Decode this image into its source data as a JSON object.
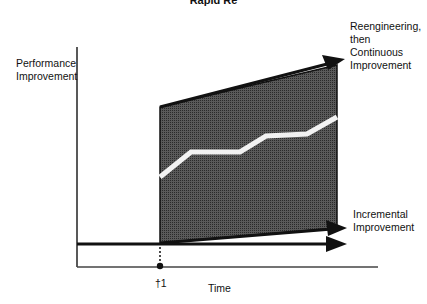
{
  "title": "Rapid Re",
  "y_axis_label": "Performance\nImprovement",
  "x_axis_label": "Time",
  "marker_label": "†1",
  "upper_label": "Reengineering,\nthen\nContinuous\nImprovement",
  "lower_label": "Incremental\nImprovement",
  "colors": {
    "shade": "#4a4a4a",
    "line": "#111111",
    "highlight": "#f2f2f2"
  }
}
